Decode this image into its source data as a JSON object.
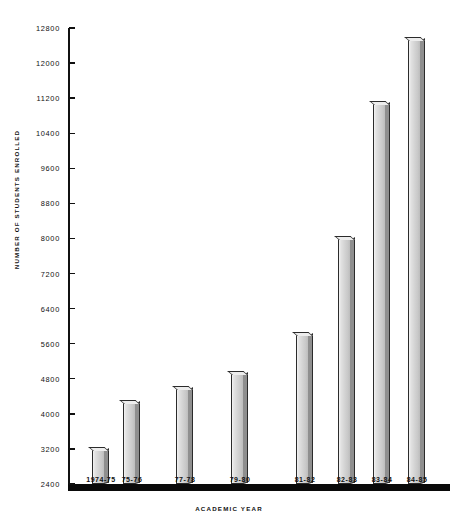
{
  "chart_data": {
    "type": "bar",
    "title": "",
    "xlabel": "ACADEMIC  YEAR",
    "ylabel": "NUMBER  OF  STUDENTS  ENROLLED",
    "categories": [
      "1974-75",
      "75-76",
      "77-78",
      "79-80",
      "81-82",
      "82-83",
      "83-84",
      "84-85"
    ],
    "values": [
      3170,
      4250,
      4570,
      4900,
      5800,
      7980,
      11060,
      12530
    ],
    "ylim": [
      2400,
      12800
    ],
    "ytick_step": 800,
    "yticks": [
      2400,
      3200,
      4000,
      4800,
      5600,
      6400,
      7200,
      8000,
      8800,
      9600,
      10400,
      11200,
      12000,
      12800
    ],
    "ytick_labels": [
      "2400",
      "3200",
      "4000",
      "4800",
      "5600",
      "6400",
      "7200",
      "8000",
      "8800",
      "9600",
      "10400",
      "11200",
      "12000",
      "12800"
    ],
    "grid": false,
    "legend": null,
    "bar_color": "#d8d8d8",
    "bar_edge_color": "#2b2b2b",
    "axis_color": "#111111"
  }
}
